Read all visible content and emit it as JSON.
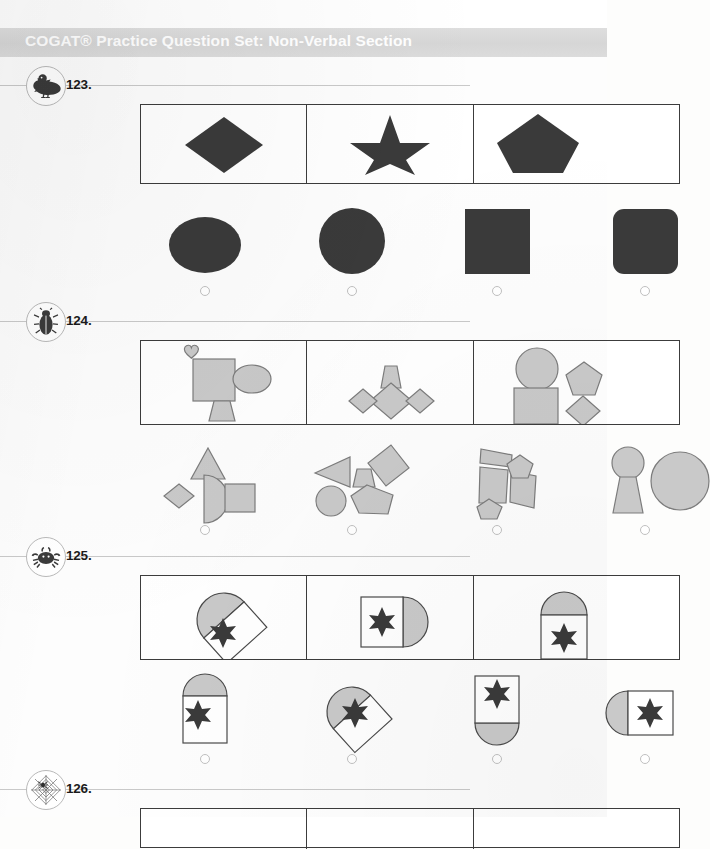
{
  "document": {
    "header_title": "COGAT® Practice Question Set: Non-Verbal Section",
    "header_band_color": "#d8d8d8",
    "header_text_color": "#ffffff",
    "page_background": "#fdfdfd",
    "dark_shape_color": "#3a3a3a",
    "light_shape_fill": "#c9c9c9",
    "light_shape_stroke": "#7c7c7c",
    "box_border_color": "#3c3c3c",
    "bubble_border_color": "#c0c0c0"
  },
  "questions": [
    {
      "number": "123.",
      "icon": "duck-icon",
      "prompt_shapes": [
        "diamond",
        "star",
        "pentagon"
      ],
      "prompt_style": "solid-dark",
      "answers": [
        {
          "letter": "A",
          "shape": "ellipse",
          "selected": false
        },
        {
          "letter": "B",
          "shape": "circle",
          "selected": false
        },
        {
          "letter": "C",
          "shape": "square",
          "selected": false
        },
        {
          "letter": "D",
          "shape": "rounded-square",
          "selected": false
        }
      ]
    },
    {
      "number": "124.",
      "icon": "beetle-icon",
      "prompt_shapes": [
        "heart, square, ellipse, trapezoid",
        "trapezoid above three diamonds",
        "circle, square, pentagon, diamond"
      ],
      "prompt_style": "outlined-gray",
      "answers": [
        {
          "letter": "A",
          "shape": "triangle, diamond, half-circle, square",
          "selected": false
        },
        {
          "letter": "B",
          "shape": "triangle, trapezoid, diamond, circle, pentagon",
          "selected": false
        },
        {
          "letter": "C",
          "shape": "rectangles and pentagons",
          "selected": false
        },
        {
          "letter": "D",
          "shape": "circle, trapezoid, circle",
          "selected": false
        }
      ]
    },
    {
      "number": "125.",
      "icon": "crab-icon",
      "prompt_shapes": [
        "rotated square with dome, six-pointed star",
        "square with half-circle right, six-pointed star",
        "square with dome top, six-pointed star"
      ],
      "prompt_style": "white-with-gray-dome",
      "answers": [
        {
          "letter": "A",
          "shape": "square with dome top, star",
          "selected": false
        },
        {
          "letter": "B",
          "shape": "rotated square with dome, star",
          "selected": false
        },
        {
          "letter": "C",
          "shape": "square with dome bottom, star",
          "selected": false
        },
        {
          "letter": "D",
          "shape": "square with half-circle left, star",
          "selected": false
        }
      ]
    },
    {
      "number": "126.",
      "icon": "spiderweb-icon",
      "prompt_shapes": [],
      "prompt_style": "",
      "answers": []
    }
  ]
}
